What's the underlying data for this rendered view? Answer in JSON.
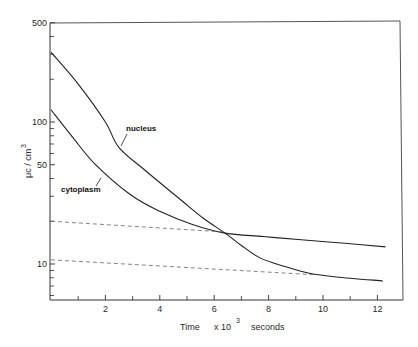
{
  "chart_data": {
    "type": "line",
    "title": "",
    "xlabel": "Time  x 10³  seconds",
    "xlabel_parts": {
      "word": "Time",
      "multiplier": "x 10",
      "exponent": "3",
      "unit": "seconds"
    },
    "ylabel": "μc / cm³",
    "ylabel_parts": {
      "base": "μc / cm",
      "exponent": "3"
    },
    "yscale": "log",
    "xlim": [
      0,
      13
    ],
    "ylim": [
      5.6,
      500
    ],
    "x_ticks": [
      2,
      4,
      6,
      8,
      10,
      12
    ],
    "x_minor_ticks": [
      1,
      3,
      5,
      7,
      9,
      11
    ],
    "y_tick_labels": [
      10,
      50,
      100,
      500
    ],
    "y_minor_ticks": [
      6,
      7,
      8,
      9,
      20,
      30,
      40,
      60,
      70,
      80,
      90,
      200,
      300,
      400
    ],
    "grid": false,
    "legend": "inline labels",
    "series": [
      {
        "name": "nucleus",
        "style": "solid",
        "x": [
          0,
          1,
          2,
          2.5,
          3.5,
          4.8,
          5.6,
          6.4,
          7.0,
          7.7,
          8.6,
          9.5,
          10.5,
          12.2
        ],
        "values": [
          310,
          185,
          100,
          66,
          45,
          28,
          21,
          16.5,
          13.5,
          11,
          9.6,
          8.6,
          8.1,
          7.6
        ]
      },
      {
        "name": "cytoplasm",
        "style": "solid",
        "x": [
          0,
          0.8,
          1.6,
          2.9,
          4.0,
          5.2,
          6.4,
          7.8,
          9.2,
          10.8,
          12.3
        ],
        "values": [
          122,
          78,
          51,
          31,
          23.5,
          19,
          16.5,
          15.6,
          14.8,
          14.0,
          13.2
        ]
      },
      {
        "name": "cytoplasm slow-component extrapolation",
        "style": "dashed",
        "x": [
          0,
          6.4
        ],
        "values": [
          20,
          16.8
        ]
      },
      {
        "name": "nucleus slow-component extrapolation",
        "style": "dashed",
        "x": [
          0,
          9.7
        ],
        "values": [
          10.7,
          8.4
        ]
      }
    ],
    "annotations": [
      {
        "text": "nucleus",
        "x": 3.2,
        "y": 80
      },
      {
        "text": "cytoplasm",
        "x": 0.7,
        "y": 40
      }
    ]
  },
  "labels": {
    "nucleus": "nucleus",
    "cytoplasm": "cytoplasm",
    "x_word": "Time",
    "x_mult": "x  10",
    "x_exp": "3",
    "x_unit": "seconds",
    "y_base": "μc / cm",
    "y_exp": "3"
  },
  "colors": {
    "ink": "#2a2a2a",
    "background": "#ffffff"
  }
}
